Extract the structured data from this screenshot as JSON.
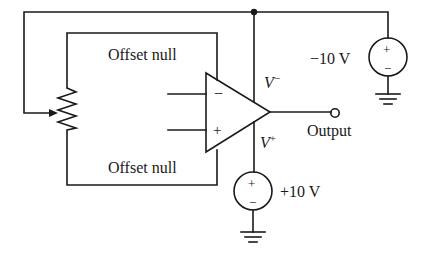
{
  "diagram": {
    "type": "op-amp offset null circuit",
    "colors": {
      "line": "#1a1a1a",
      "background": "#ffffff"
    },
    "labels": {
      "offset_null_top": "Offset null",
      "offset_null_bottom": "Offset null",
      "v_minus": "V",
      "v_minus_sup": "−",
      "v_plus": "V",
      "v_plus_sup": "+",
      "output": "Output",
      "neg_supply": "−10 V",
      "pos_supply": "+10 V"
    },
    "opamp": {
      "inverting_sign": "−",
      "noninverting_sign": "+"
    },
    "sources": [
      {
        "id": "negative-supply",
        "value": "−10 V",
        "top_sign": "+",
        "bottom_sign": "−"
      },
      {
        "id": "positive-supply",
        "value": "+10 V",
        "top_sign": "+",
        "bottom_sign": "−"
      }
    ],
    "components": [
      "potentiometer",
      "op-amp",
      "voltage-source",
      "voltage-source",
      "ground",
      "ground",
      "output-terminal",
      "junction-dot"
    ]
  }
}
